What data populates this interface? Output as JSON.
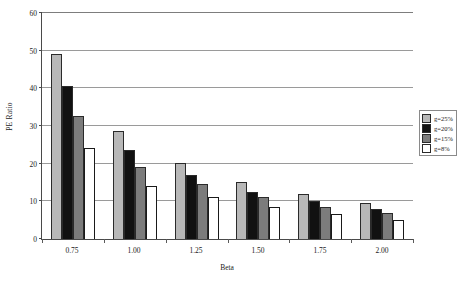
{
  "chart_data": {
    "type": "bar",
    "title": "",
    "xlabel": "Beta",
    "ylabel": "PE Ratio",
    "categories": [
      "0.75",
      "1.00",
      "1.25",
      "1.50",
      "1.75",
      "2.00"
    ],
    "ylim": [
      0,
      60
    ],
    "yticks": [
      0,
      10,
      20,
      30,
      40,
      50,
      60
    ],
    "grid": true,
    "legend_position": "right",
    "series": [
      {
        "name": "g=25%",
        "color": "#b8b8b8",
        "values": [
          49.0,
          28.5,
          20.0,
          15.0,
          12.0,
          9.5
        ]
      },
      {
        "name": "g=20%",
        "color": "#111111",
        "values": [
          40.5,
          23.5,
          17.0,
          12.5,
          10.0,
          8.0
        ]
      },
      {
        "name": "g=15%",
        "color": "#7c7c7c",
        "values": [
          32.5,
          19.0,
          14.5,
          11.0,
          8.5,
          7.0
        ]
      },
      {
        "name": "g=8%",
        "color": "#ffffff",
        "values": [
          24.0,
          14.0,
          11.0,
          8.5,
          6.5,
          5.0
        ]
      }
    ]
  }
}
